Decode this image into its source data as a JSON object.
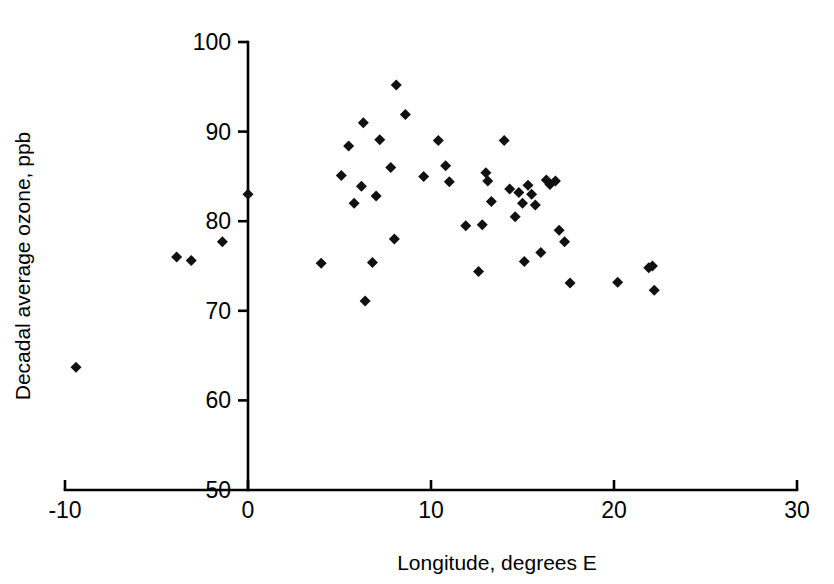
{
  "chart_data": {
    "type": "scatter",
    "title": "",
    "xlabel": "Longitude, degrees E",
    "ylabel": "Decadal average ozone, ppb",
    "xlim": [
      -10,
      30
    ],
    "ylim": [
      50,
      100
    ],
    "xticks": [
      -10,
      0,
      10,
      20,
      30
    ],
    "xtick_labels": [
      "-10",
      "0",
      "10",
      "20",
      "30"
    ],
    "yticks": [
      50,
      60,
      70,
      80,
      90,
      100
    ],
    "ytick_labels": [
      "50",
      "60",
      "70",
      "80",
      "90",
      "100"
    ],
    "grid": false,
    "legend": false,
    "marker": "diamond",
    "marker_color": "#111111",
    "marker_size": 11,
    "series": [
      {
        "name": "Decadal average ozone by longitude",
        "points": [
          [
            -9.4,
            63.7
          ],
          [
            -3.9,
            76.0
          ],
          [
            -3.1,
            75.6
          ],
          [
            -1.4,
            77.7
          ],
          [
            0.0,
            83.0
          ],
          [
            4.0,
            75.3
          ],
          [
            5.1,
            85.1
          ],
          [
            5.5,
            88.4
          ],
          [
            5.8,
            82.0
          ],
          [
            6.2,
            83.9
          ],
          [
            6.3,
            91.0
          ],
          [
            6.4,
            71.1
          ],
          [
            6.8,
            75.4
          ],
          [
            7.0,
            82.8
          ],
          [
            7.2,
            89.1
          ],
          [
            7.8,
            86.0
          ],
          [
            8.0,
            78.0
          ],
          [
            8.1,
            95.2
          ],
          [
            8.6,
            91.9
          ],
          [
            9.6,
            85.0
          ],
          [
            10.4,
            89.0
          ],
          [
            10.8,
            86.2
          ],
          [
            11.0,
            84.4
          ],
          [
            11.9,
            79.5
          ],
          [
            12.6,
            74.4
          ],
          [
            12.8,
            79.6
          ],
          [
            13.0,
            85.4
          ],
          [
            13.1,
            84.5
          ],
          [
            13.3,
            82.2
          ],
          [
            14.0,
            89.0
          ],
          [
            14.3,
            83.6
          ],
          [
            14.6,
            80.5
          ],
          [
            14.8,
            83.2
          ],
          [
            15.0,
            82.0
          ],
          [
            15.1,
            75.5
          ],
          [
            15.3,
            84.0
          ],
          [
            15.5,
            83.0
          ],
          [
            15.7,
            81.8
          ],
          [
            16.0,
            76.5
          ],
          [
            16.3,
            84.6
          ],
          [
            16.5,
            84.1
          ],
          [
            16.8,
            84.5
          ],
          [
            17.0,
            79.0
          ],
          [
            17.3,
            77.7
          ],
          [
            17.6,
            73.1
          ],
          [
            20.2,
            73.2
          ],
          [
            21.9,
            74.8
          ],
          [
            22.1,
            75.0
          ],
          [
            22.2,
            72.3
          ]
        ]
      }
    ]
  },
  "axes": {
    "x_axis_label": "Longitude, degrees E",
    "y_axis_label": "Decadal average ozone, ppb"
  }
}
